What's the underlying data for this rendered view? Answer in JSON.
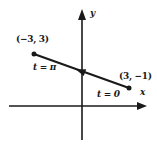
{
  "figure": {
    "axes": {
      "x_label": "x",
      "y_label": "y"
    },
    "segment": {
      "start_point": {
        "coords_label": "(3, −1)",
        "param_label": "t = 0",
        "x": 3,
        "y": -1
      },
      "end_point": {
        "coords_label": "(−3, 3)",
        "param_label": "t = π",
        "x": -3,
        "y": 3
      },
      "direction": "arrow on segment points from (3, −1) toward (−3, 3)"
    },
    "colors": {
      "ink": "#1a1a1a",
      "background": "#ffffff"
    }
  }
}
